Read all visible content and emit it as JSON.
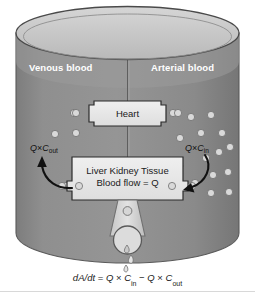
{
  "figure": {
    "type": "physiological-clearance-schematic",
    "background": "#ffffff"
  },
  "colors": {
    "body_fill": "#8c8c8c",
    "body_fill_dark": "#808080",
    "surface_fill": "#c8c8c8",
    "rim_stroke": "#4a4a4a",
    "box_fill": "#e8e8e8",
    "box_stroke": "#2b2b2b",
    "particle_fill": "#d9d9d9",
    "particle_stroke": "#6e6e6e",
    "label_text": "#ffffff",
    "body_text": "#1a1a1a",
    "arrow": "#111111"
  },
  "labels": {
    "venous": "Venous blood",
    "arterial": "Arterial blood"
  },
  "boxes": {
    "heart": {
      "label": "Heart"
    },
    "tissue": {
      "line1": "Liver Kidney Tissue",
      "line2": "Blood flow = Q"
    }
  },
  "flux": {
    "out": {
      "q": "Q",
      "times": "×",
      "c": "C",
      "sub": "out"
    },
    "in": {
      "q": "Q",
      "times": "×",
      "c": "C",
      "sub": "in"
    }
  },
  "equation": {
    "lhs_d": "d",
    "lhs_a": "A",
    "lhs_slash": "/",
    "lhs_dt_d": "d",
    "lhs_dt_t": "t",
    "eq": "=",
    "q1": "Q",
    "x1": "×",
    "c1": "C",
    "sub1": "in",
    "minus": "−",
    "q2": "Q",
    "x2": "×",
    "c2": "C",
    "sub2": "out",
    "full": "dA/dt = Q × Cin − Q × Cout"
  },
  "particles": {
    "arterial_side_count": 14,
    "venous_side_count": 5,
    "meaning": "light circles depict solute concentration; arterial (right) higher than venous (left)"
  },
  "arrows": {
    "left": {
      "name": "outflow-arrow",
      "direction": "up-left"
    },
    "right": {
      "name": "inflow-arrow",
      "direction": "down-left"
    }
  },
  "drain": {
    "name": "urine-drain",
    "droplets": 2
  }
}
